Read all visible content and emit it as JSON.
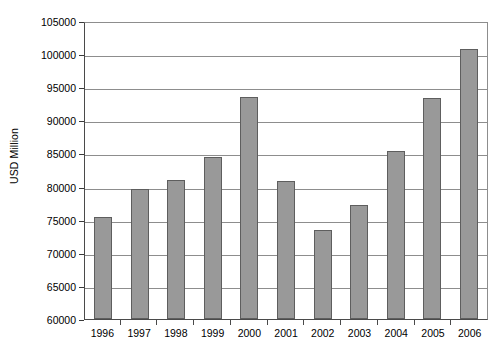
{
  "chart_data": {
    "type": "bar",
    "title": "",
    "subtitle": "",
    "xlabel": "",
    "ylabel": "USD Million",
    "categories": [
      "1996",
      "1997",
      "1998",
      "1999",
      "2000",
      "2001",
      "2002",
      "2003",
      "2004",
      "2005",
      "2006"
    ],
    "values": [
      75400,
      79600,
      81000,
      84400,
      93500,
      80800,
      73400,
      77200,
      85400,
      93300,
      100800
    ],
    "series": [
      {
        "name": "USD Million",
        "values": [
          75400,
          79600,
          81000,
          84400,
          93500,
          80800,
          73400,
          77200,
          85400,
          93300,
          100800
        ]
      }
    ],
    "ylim": [
      60000,
      105000
    ],
    "ytick_step": 5000,
    "yticks": [
      60000,
      65000,
      70000,
      75000,
      80000,
      85000,
      90000,
      95000,
      100000,
      105000
    ],
    "ytick_labels": [
      "60000",
      "65000",
      "70000",
      "75000",
      "80000",
      "85000",
      "90000",
      "95000",
      "100000",
      "105000"
    ],
    "grid": "horizontal",
    "legend": "none",
    "bar_color": "#999999",
    "bar_border_color": "#5e5e5e",
    "grid_color": "#8d8d8d",
    "axis_color": "#4a4a4a",
    "background": "#ffffff"
  }
}
